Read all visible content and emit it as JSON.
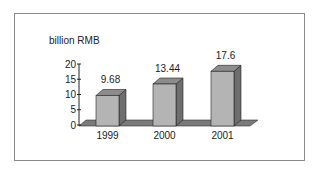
{
  "chart_data": {
    "type": "bar",
    "style": "3d-column",
    "title": "",
    "ylabel": "billion RMB",
    "xlabel": "",
    "categories": [
      "1999",
      "2000",
      "2001"
    ],
    "values": [
      9.68,
      13.44,
      17.6
    ],
    "data_labels": [
      "9.68",
      "13.44",
      "17.6"
    ],
    "ylim": [
      0,
      20
    ],
    "yticks": [
      "0",
      "5",
      "10",
      "15",
      "20"
    ],
    "grid": false,
    "legend": null
  },
  "colors": {
    "bar_front": "#b4b4b4",
    "bar_top": "#8c8c8c",
    "bar_side": "#6e6e6e",
    "floor": "#7a7a7a",
    "frame": "#8a8a8a"
  }
}
